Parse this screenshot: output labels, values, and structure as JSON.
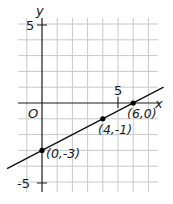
{
  "chart_data": {
    "type": "line",
    "title": "",
    "xlabel": "x",
    "ylabel": "y",
    "origin_label": "O",
    "xlim": [
      -1,
      8
    ],
    "ylim": [
      -5.4,
      5
    ],
    "grid": true,
    "x_tick_labels": [
      {
        "value": 5,
        "label": "5"
      }
    ],
    "y_tick_labels": [
      {
        "value": 5,
        "label": "5"
      },
      {
        "value": -5,
        "label": "-5"
      }
    ],
    "series": [
      {
        "name": "line",
        "equation": "y = 0.5x - 3",
        "slope": 0.5,
        "intercept": -3,
        "x": [
          -2.3,
          8
        ],
        "y": [
          -4.15,
          1
        ]
      }
    ],
    "points": [
      {
        "x": 0,
        "y": -3,
        "label": "(0,-3)"
      },
      {
        "x": 4,
        "y": -1,
        "label": "(4,-1)"
      },
      {
        "x": 6,
        "y": 0,
        "label": "(6,0)"
      }
    ],
    "colors": {
      "grid": "#c8c8c8",
      "axis": "#1a1a1a",
      "line": "#111111",
      "point": "#000000"
    }
  }
}
